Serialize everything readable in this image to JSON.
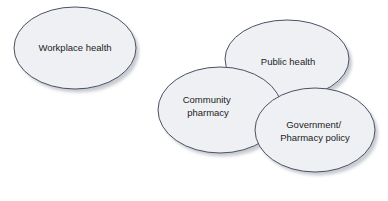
{
  "diagram": {
    "type": "venn",
    "background_color": "#ffffff",
    "ellipse_fill": "#eef0f4",
    "ellipse_stroke": "#4a5160",
    "shadow_color": "#b9bcc2",
    "text_color": "#1c1c1c",
    "shapes": [
      {
        "id": "workplace-health",
        "label": "Workplace health",
        "lines": [
          "Workplace health"
        ],
        "cx": 75,
        "cy": 48,
        "rx": 61,
        "ry": 41,
        "overlaps": []
      },
      {
        "id": "public-health",
        "label": "Public health",
        "lines": [
          "Public health"
        ],
        "cx": 287,
        "cy": 59,
        "rx": 62,
        "ry": 39,
        "overlaps": [
          "community-pharmacy",
          "government-pharmacy-policy"
        ]
      },
      {
        "id": "community-pharmacy",
        "label": "Community pharmacy",
        "lines": [
          "Community",
          "pharmacy"
        ],
        "cx": 220,
        "cy": 110,
        "rx": 62,
        "ry": 43,
        "overlaps": [
          "public-health",
          "government-pharmacy-policy"
        ]
      },
      {
        "id": "government-pharmacy-policy",
        "label": "Government/ Pharmacy policy",
        "lines": [
          "Government/",
          "Pharmacy policy"
        ],
        "cx": 315,
        "cy": 130,
        "rx": 60,
        "ry": 42,
        "overlaps": [
          "public-health",
          "community-pharmacy"
        ]
      }
    ]
  }
}
